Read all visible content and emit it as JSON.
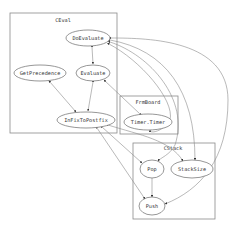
{
  "diagram": {
    "type": "call-graph",
    "clusters": [
      {
        "id": "ceval",
        "label": "CEval",
        "x": 10,
        "y": 13,
        "w": 107,
        "h": 120,
        "label_x": 63,
        "label_y": 22
      },
      {
        "id": "frmboard",
        "label": "FrmBoard",
        "x": 120,
        "y": 96,
        "w": 58,
        "h": 38,
        "label_x": 148,
        "label_y": 104
      },
      {
        "id": "cstack",
        "label": "CStack",
        "x": 133,
        "y": 143,
        "w": 82,
        "h": 76,
        "label_x": 173,
        "label_y": 150
      }
    ],
    "nodes": [
      {
        "id": "doevaluate",
        "label": "DoEvaluate",
        "cluster": "ceval",
        "cx": 88,
        "cy": 38,
        "rx": 22,
        "ry": 8
      },
      {
        "id": "getprecedence",
        "label": "GetPrecedence",
        "cluster": "ceval",
        "cx": 40,
        "cy": 73,
        "rx": 26,
        "ry": 8
      },
      {
        "id": "evaluate",
        "label": "Evaluate",
        "cluster": "ceval",
        "cx": 93,
        "cy": 73,
        "rx": 17,
        "ry": 8
      },
      {
        "id": "infixtopostfix",
        "label": "InFixToPostfix",
        "cluster": "ceval",
        "cx": 86,
        "cy": 120,
        "rx": 29,
        "ry": 8
      },
      {
        "id": "timer",
        "label": "Timer.Timer",
        "cluster": "frmboard",
        "cx": 148,
        "cy": 122,
        "rx": 24,
        "ry": 8
      },
      {
        "id": "pop",
        "label": "Pop",
        "cluster": "cstack",
        "cx": 152,
        "cy": 169,
        "rx": 12,
        "ry": 9
      },
      {
        "id": "stacksize",
        "label": "StackSize",
        "cluster": "cstack",
        "cx": 192,
        "cy": 169,
        "rx": 21,
        "ry": 9
      },
      {
        "id": "push",
        "label": "Push",
        "cluster": "cstack",
        "cx": 152,
        "cy": 206,
        "rx": 13,
        "ry": 9
      }
    ],
    "edges": [
      {
        "from": "doevaluate",
        "to": "evaluate",
        "bidirectional": true,
        "d": "M92,47 L93,64"
      },
      {
        "from": "getprecedence",
        "to": "infixtopostfix",
        "bidirectional": true,
        "d": "M50,82 L76,112"
      },
      {
        "from": "evaluate",
        "to": "infixtopostfix",
        "bidirectional": true,
        "d": "M93,82 L88,111"
      },
      {
        "from": "timer",
        "to": "evaluate",
        "bidirectional": true,
        "d": "M140,114 L104,80"
      },
      {
        "from": "doevaluate",
        "to": "pop",
        "bidirectional": true,
        "d": "M110,42 C150,55 190,100 175,145 C170,155 160,158 158,161"
      },
      {
        "from": "doevaluate",
        "to": "stacksize",
        "bidirectional": true,
        "d": "M110,40 C165,50 195,90 195,160"
      },
      {
        "from": "doevaluate",
        "to": "push",
        "bidirectional": true,
        "d": "M111,38 C150,38 228,40 228,100 C228,160 200,190 165,204"
      },
      {
        "from": "doevaluate",
        "to": "timer",
        "bidirectional": true,
        "d": "M109,44 C140,60 175,100 170,120 C165,130 150,135 150,130"
      },
      {
        "from": "infixtopostfix",
        "to": "pop",
        "bidirectional": true,
        "d": "M102,127 L142,163"
      },
      {
        "from": "infixtopostfix",
        "to": "push",
        "bidirectional": true,
        "d": "M97,128 L145,199"
      },
      {
        "from": "infixtopostfix",
        "to": "stacksize",
        "bidirectional": true,
        "d": "M108,125 C140,135 170,140 183,161"
      },
      {
        "from": "pop",
        "to": "push",
        "bidirectional": false,
        "d": "M152,178 L152,197"
      }
    ],
    "colors": {
      "edge": "#8a8a8a",
      "node_border": "#6a6a6a",
      "cluster_border": "#8a8a8a",
      "text": "#333333",
      "background": "#ffffff"
    }
  }
}
